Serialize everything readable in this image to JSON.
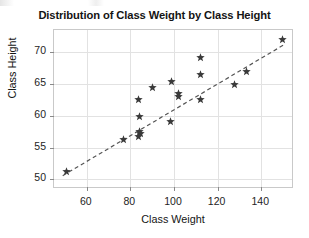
{
  "figure": {
    "title": "Distribution of Class Weight by Class Height",
    "marker_icon": "star-marker",
    "marker_color": "#3a3a3a",
    "gridline_color": "#e2e2e2",
    "frame_color": "#c9c9c9",
    "trendline_color": "#555555",
    "trendline_style": "dashed",
    "background_color": "#ffffff"
  },
  "chart_data": {
    "type": "scatter",
    "title": "Distribution of Class Weight by Class Height",
    "xlabel": "Class Weight",
    "ylabel": "Class Height",
    "xlim": [
      45,
      155
    ],
    "ylim": [
      48.5,
      73.5
    ],
    "xticks": [
      60,
      80,
      100,
      120,
      140
    ],
    "yticks": [
      50,
      55,
      60,
      65,
      70
    ],
    "grid": true,
    "legend": null,
    "series": [
      {
        "name": "Class observations",
        "marker": "star",
        "color": "#3a3a3a",
        "points": [
          [
            50.5,
            51.2
          ],
          [
            77.0,
            56.3
          ],
          [
            83.5,
            56.7
          ],
          [
            84.5,
            57.3
          ],
          [
            84.0,
            57.6
          ],
          [
            84.2,
            59.9
          ],
          [
            83.8,
            62.6
          ],
          [
            90.0,
            64.4
          ],
          [
            98.5,
            59.1
          ],
          [
            98.8,
            65.4
          ],
          [
            102.0,
            63.0
          ],
          [
            102.2,
            63.5
          ],
          [
            112.0,
            62.6
          ],
          [
            112.3,
            66.5
          ],
          [
            112.0,
            69.1
          ],
          [
            127.5,
            64.9
          ],
          [
            133.0,
            67.0
          ],
          [
            149.5,
            72.0
          ]
        ]
      }
    ],
    "annotations": [
      {
        "type": "trendline",
        "style": "dashed",
        "color": "#555555",
        "from": [
          49.0,
          50.6
        ],
        "to": [
          151.0,
          71.3
        ]
      }
    ]
  },
  "axes": {
    "x_tick_labels": [
      "60",
      "80",
      "100",
      "120",
      "140"
    ],
    "y_tick_labels": [
      "70",
      "65",
      "60",
      "55",
      "50"
    ],
    "x_title": "Class Weight",
    "y_title": "Class Height"
  }
}
